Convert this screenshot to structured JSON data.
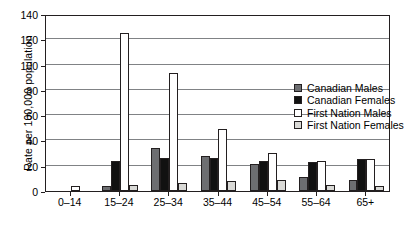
{
  "chart_data": {
    "type": "bar",
    "title": "",
    "xlabel": "",
    "ylabel": "Rate per 100,000 population",
    "ylim": [
      0,
      140
    ],
    "yticks": [
      0,
      20,
      40,
      60,
      80,
      100,
      120,
      140
    ],
    "grid": true,
    "legend_position": "inside-upper-right",
    "categories": [
      "0–14",
      "15–24",
      "25–34",
      "35–44",
      "45–54",
      "55–64",
      "65+"
    ],
    "series": [
      {
        "name": "Canadian Males",
        "color": "#6d6e71",
        "values": [
          0,
          4,
          34,
          28,
          21,
          11,
          9
        ]
      },
      {
        "name": "Canadian Females",
        "color": "#111111",
        "values": [
          0,
          24,
          26,
          26,
          24,
          23,
          25
        ]
      },
      {
        "name": "First Nation Males",
        "color": "#ffffff",
        "values": [
          4,
          125,
          93,
          49,
          30,
          24,
          25
        ]
      },
      {
        "name": "First Nation Females",
        "color": "#d9d9d6",
        "values": [
          0,
          5,
          6,
          8,
          9,
          5,
          4
        ]
      }
    ]
  },
  "legend": {
    "items": [
      {
        "label": "Canadian Males"
      },
      {
        "label": "Canadian Females"
      },
      {
        "label": "First Nation Males"
      },
      {
        "label": "First Nation Females"
      }
    ]
  }
}
